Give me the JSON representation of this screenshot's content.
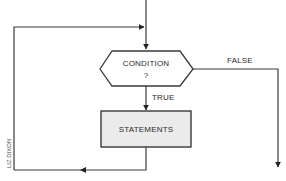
{
  "diagram": {
    "type": "flowchart-while-loop",
    "nodes": {
      "condition": {
        "label_line1": "CONDITION",
        "label_line2": "?",
        "shape": "hexagon"
      },
      "statements": {
        "label": "STATEMENTS",
        "shape": "rectangle",
        "fill": "#ebebeb"
      }
    },
    "edges": {
      "true_label": "TRUE",
      "false_label": "FALSE"
    },
    "credit": "LIZ DIXON",
    "colors": {
      "line": "#3a3a3a",
      "box_fill": "#ebebeb",
      "background": "#ffffff"
    }
  }
}
